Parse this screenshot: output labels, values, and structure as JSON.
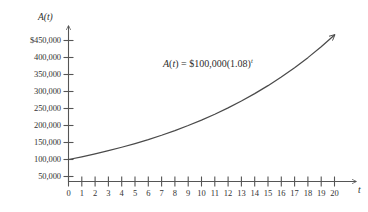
{
  "chart_data": {
    "type": "line",
    "title": "",
    "subtitle": "",
    "xlabel": "t",
    "ylabel": "A(t)",
    "annotation": "A(t) = $100,000(1.08)^t",
    "annotation_parts": {
      "function_name": "A",
      "variable_open": "(",
      "variable": "t",
      "variable_close": ")",
      "equals": "=",
      "principal": "$100,000",
      "base_open": "(",
      "base": "1.08",
      "base_close": ")",
      "exponent": "t"
    },
    "grid": false,
    "legend": false,
    "xlim": [
      0,
      20
    ],
    "ylim": [
      0,
      475000
    ],
    "x_tick_labels": [
      "0",
      "1",
      "2",
      "3",
      "4",
      "5",
      "6",
      "7",
      "8",
      "9",
      "10",
      "11",
      "12",
      "13",
      "14",
      "15",
      "16",
      "17",
      "18",
      "19",
      "20"
    ],
    "x_tick_values": [
      0,
      1,
      2,
      3,
      4,
      5,
      6,
      7,
      8,
      9,
      10,
      11,
      12,
      13,
      14,
      15,
      16,
      17,
      18,
      19,
      20
    ],
    "y_tick_labels": [
      "$450,000",
      "400,000",
      "350,000",
      "300,000",
      "250,000",
      "200,000",
      "150,000",
      "100,000",
      "50,000"
    ],
    "y_tick_values": [
      450000,
      400000,
      350000,
      300000,
      250000,
      200000,
      150000,
      100000,
      50000
    ],
    "series": [
      {
        "name": "A(t) = $100,000(1.08)^t",
        "x": [
          0,
          1,
          2,
          3,
          4,
          5,
          6,
          7,
          8,
          9,
          10,
          11,
          12,
          13,
          14,
          15,
          16,
          17,
          18,
          19,
          20
        ],
        "values": [
          100000,
          108000,
          116640,
          125971,
          136049,
          146933,
          158687,
          171382,
          185093,
          199900,
          215892,
          233164,
          251817,
          271962,
          293719,
          317217,
          342594,
          370002,
          399602,
          431570,
          466096
        ]
      }
    ],
    "axes_have_arrowheads": true,
    "curve_has_arrowhead": true,
    "line_color": "#4a4a4a",
    "axis_color": "#555555",
    "background_color": "#ffffff"
  }
}
